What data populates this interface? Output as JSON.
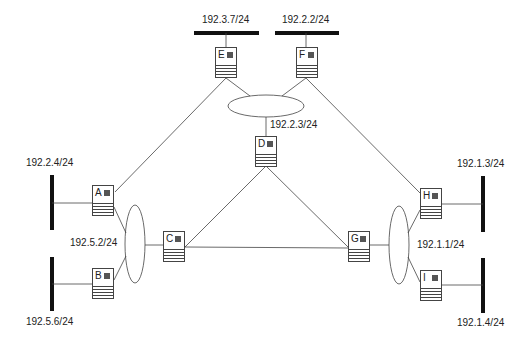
{
  "routers": [
    {
      "id": "A",
      "x": 92,
      "y": 185
    },
    {
      "id": "B",
      "x": 92,
      "y": 268
    },
    {
      "id": "C",
      "x": 163,
      "y": 231
    },
    {
      "id": "D",
      "x": 255,
      "y": 136
    },
    {
      "id": "E",
      "x": 215,
      "y": 47
    },
    {
      "id": "F",
      "x": 296,
      "y": 47
    },
    {
      "id": "G",
      "x": 348,
      "y": 231
    },
    {
      "id": "H",
      "x": 420,
      "y": 188
    },
    {
      "id": "I",
      "x": 420,
      "y": 270
    }
  ],
  "labels": {
    "net_e": "192.3.7/24",
    "net_f": "192.2.2/24",
    "net_d": "192.2.3/24",
    "net_a": "192.2.4/24",
    "net_ab": "192.5.2/24",
    "net_b": "192.5.6/24",
    "net_h": "192.1.3/24",
    "net_gi": "192.1.1/24",
    "net_i": "192.1.4/24"
  }
}
